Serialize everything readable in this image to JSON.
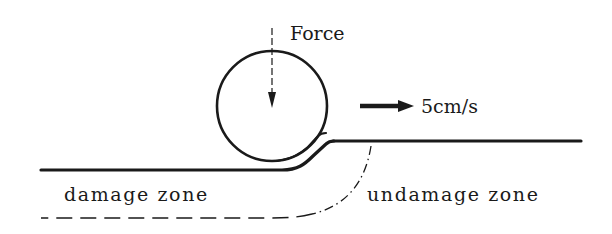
{
  "diagram": {
    "labels": {
      "force": "Force",
      "velocity": "5cm/s",
      "damage_zone": "damage zone",
      "undamage_zone": "undamage zone"
    },
    "colors": {
      "ink": "#1a1a1a",
      "background": "#ffffff"
    },
    "elements": {
      "roller": "circle",
      "force_arrow": "dashed downward arrow",
      "velocity_arrow": "bold rightward arrow",
      "surface_damaged": "lower surface (compressed)",
      "surface_undamaged": "upper surface",
      "zone_boundary": "dash-dot / dashed boundary curve"
    }
  }
}
